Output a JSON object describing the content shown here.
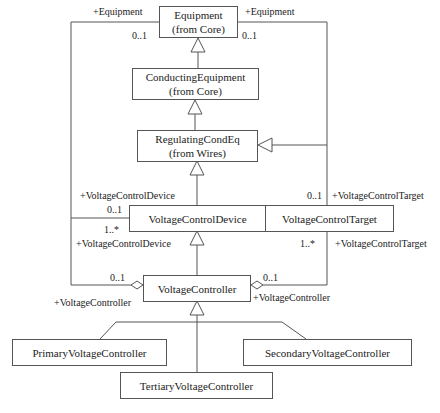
{
  "classes": {
    "equipment": {
      "name": "Equipment",
      "package": "(from Core)"
    },
    "conducting_equipment": {
      "name": "ConductingEquipment",
      "package": "(from Core)"
    },
    "regulating_cond_eq": {
      "name": "RegulatingCondEq",
      "package": "(from Wires)"
    },
    "voltage_control_device": {
      "name": "VoltageControlDevice"
    },
    "voltage_control_target": {
      "name": "VoltageControlTarget"
    },
    "voltage_controller": {
      "name": "VoltageController"
    },
    "primary_voltage_controller": {
      "name": "PrimaryVoltageController"
    },
    "secondary_voltage_controller": {
      "name": "SecondaryVoltageController"
    },
    "tertiary_voltage_controller": {
      "name": "TertiaryVoltageController"
    }
  },
  "labels": {
    "equipment_left_role": "+Equipment",
    "equipment_right_role": "+Equipment",
    "equipment_left_mult": "0..1",
    "equipment_right_mult": "0..1",
    "vcd_upper_role": "+VoltageControlDevice",
    "vcd_upper_mult": "0..1",
    "vcd_lower_mult": "1..*",
    "vcd_lower_role": "+VoltageControlDevice",
    "vct_upper_mult": "0..1",
    "vct_upper_role": "+VoltageControlTarget",
    "vct_lower_mult": "1..*",
    "vct_lower_role": "+VoltageControlTarget",
    "vc_left_mult": "0..1",
    "vc_right_mult": "0..1",
    "vc_left_role": "+VoltageController",
    "vc_right_role": "+VoltageController"
  }
}
